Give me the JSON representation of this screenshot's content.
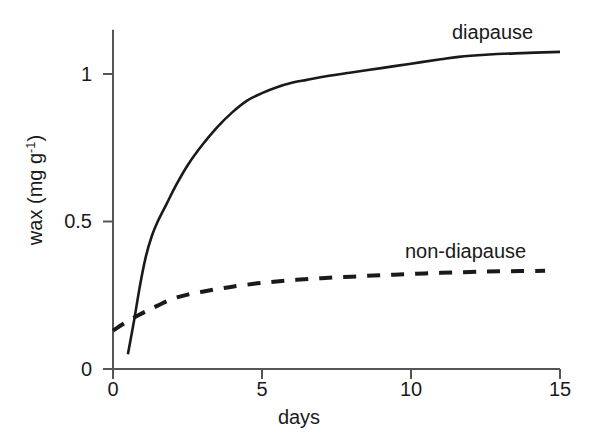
{
  "chart_data": {
    "type": "line",
    "title": "",
    "xlabel": "days",
    "ylabel": "wax (mg g-1)",
    "ylabel_base": "wax (mg g",
    "ylabel_sup": "-1",
    "ylabel_tail": ")",
    "xlim": [
      0,
      15
    ],
    "ylim": [
      0,
      1.15
    ],
    "xticks": [
      0,
      5,
      10,
      15
    ],
    "xtick_labels": [
      "0",
      "5",
      "10",
      "15"
    ],
    "yticks": [
      0,
      0.5,
      1
    ],
    "ytick_labels": [
      "0",
      "0.5",
      "1"
    ],
    "grid": false,
    "legend_position": "inline-annotations",
    "axis_color": "#555555",
    "line_color": "#1a1a1a",
    "series": [
      {
        "name": "diapause",
        "style": "solid",
        "label_x": 11.4,
        "label_y": 1.17,
        "x": [
          0.5,
          0.7,
          0.9,
          1.1,
          1.3,
          1.5,
          1.8,
          2.1,
          2.5,
          3.0,
          3.5,
          4.0,
          4.5,
          5.0,
          5.5,
          6.0,
          6.5,
          7.0,
          8.0,
          9.0,
          10.0,
          11.0,
          11.6,
          12.5,
          13.5,
          15.0
        ],
        "y": [
          0.05,
          0.16,
          0.28,
          0.38,
          0.45,
          0.5,
          0.56,
          0.62,
          0.69,
          0.76,
          0.82,
          0.87,
          0.91,
          0.935,
          0.955,
          0.97,
          0.98,
          0.99,
          1.005,
          1.02,
          1.035,
          1.05,
          1.058,
          1.065,
          1.07,
          1.075
        ]
      },
      {
        "name": "non-diapause",
        "style": "dashed",
        "label_x": 9.8,
        "label_y": 0.43,
        "x": [
          0.0,
          0.3,
          0.6,
          0.9,
          1.2,
          1.5,
          2.0,
          2.5,
          3.0,
          3.5,
          4.0,
          5.0,
          6.0,
          7.0,
          8.0,
          9.0,
          10.0,
          11.0,
          12.0,
          13.0,
          14.5
        ],
        "y": [
          0.13,
          0.15,
          0.168,
          0.185,
          0.2,
          0.215,
          0.238,
          0.252,
          0.262,
          0.271,
          0.279,
          0.292,
          0.301,
          0.308,
          0.313,
          0.318,
          0.322,
          0.326,
          0.329,
          0.331,
          0.333
        ]
      }
    ]
  },
  "labels": {
    "diapause": "diapause",
    "non_diapause": "non-diapause",
    "xaxis_title": "days",
    "ytick_0": "0",
    "ytick_05": "0.5",
    "ytick_1": "1",
    "xtick_0": "0",
    "xtick_5": "5",
    "xtick_10": "10",
    "xtick_15": "15"
  }
}
